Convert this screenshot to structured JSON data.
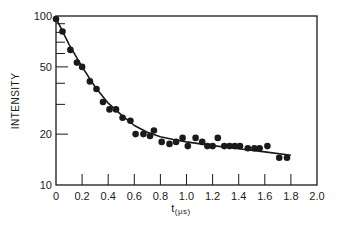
{
  "chart_data": {
    "type": "scatter",
    "title": "",
    "xlabel": "t",
    "xlabel_unit": "(μs)",
    "ylabel": "INTENSITY",
    "xlim": [
      0,
      2.0
    ],
    "ylim": [
      10,
      100
    ],
    "yscale": "log",
    "grid": false,
    "legend": null,
    "x_ticks": [
      "0",
      "0.2",
      "0.4",
      "0.6",
      "0.8",
      "1.0",
      "1.2",
      "1.4",
      "1.6",
      "1.8",
      "2.0"
    ],
    "y_ticks": [
      "10",
      "20",
      "50",
      "100"
    ],
    "series": [
      {
        "name": "measured",
        "style": "markers",
        "x": [
          0.0,
          0.05,
          0.11,
          0.16,
          0.2,
          0.26,
          0.31,
          0.36,
          0.41,
          0.46,
          0.51,
          0.57,
          0.61,
          0.67,
          0.72,
          0.75,
          0.81,
          0.87,
          0.92,
          0.97,
          1.01,
          1.07,
          1.12,
          1.16,
          1.2,
          1.24,
          1.29,
          1.33,
          1.37,
          1.41,
          1.47,
          1.52,
          1.56,
          1.62,
          1.71,
          1.77
        ],
        "y": [
          96,
          81,
          63,
          53,
          50,
          41,
          37,
          31,
          28,
          28,
          25,
          24,
          20,
          20,
          19.5,
          21,
          18,
          17.5,
          18,
          19,
          17,
          19,
          18,
          17,
          17,
          19,
          17,
          17,
          17,
          17,
          16.5,
          16.5,
          16.5,
          17,
          14.5,
          14.5
        ]
      },
      {
        "name": "fit",
        "style": "line",
        "x": [
          0.0,
          0.1,
          0.2,
          0.3,
          0.4,
          0.5,
          0.6,
          0.7,
          0.8,
          0.9,
          1.0,
          1.2,
          1.4,
          1.6,
          1.8
        ],
        "y": [
          97,
          68,
          50,
          38,
          30.5,
          26,
          22.5,
          20.5,
          19.3,
          18.6,
          18.0,
          17.1,
          16.4,
          15.7,
          15.0
        ]
      }
    ]
  }
}
